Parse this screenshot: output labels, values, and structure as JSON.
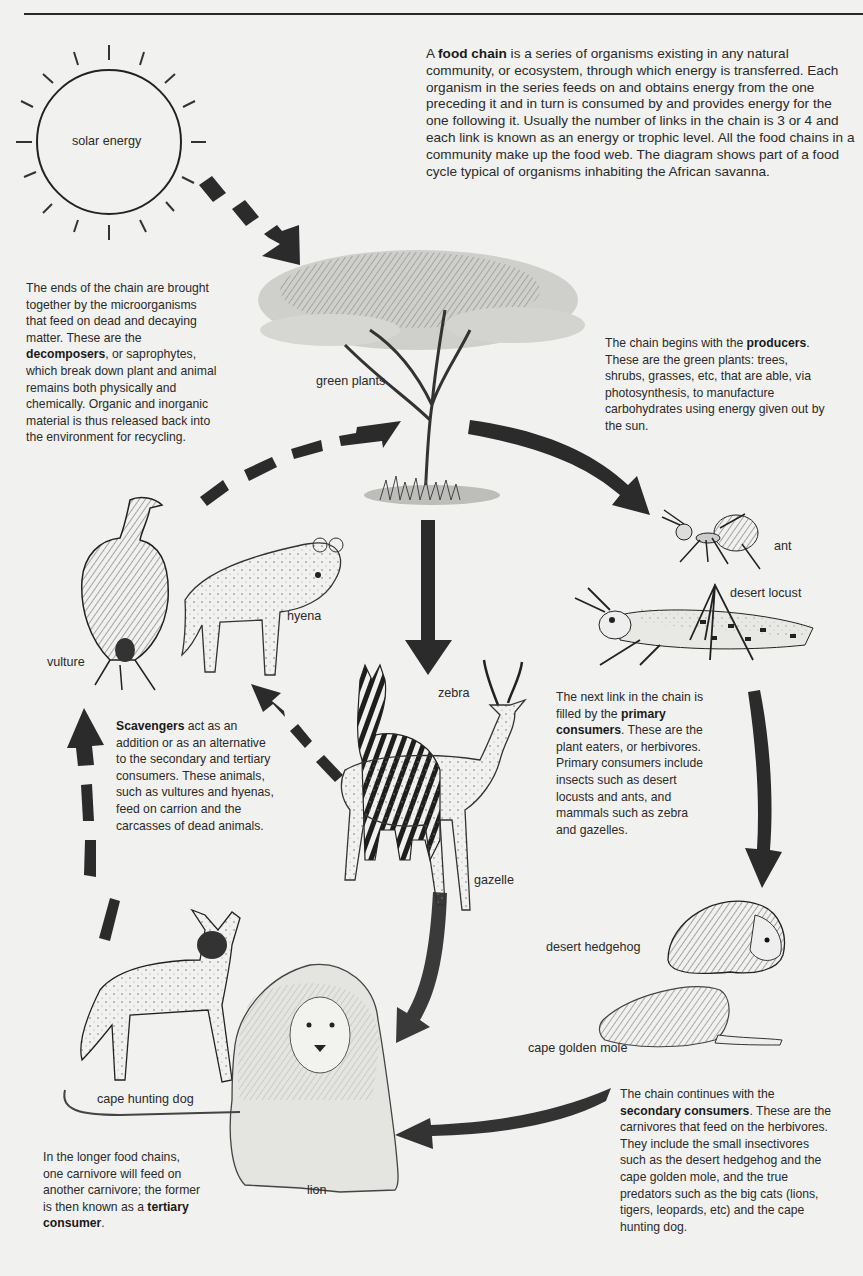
{
  "diagram": {
    "title_text": "Food chain of the African savanna",
    "intro": {
      "pre": "A ",
      "bold": "food chain",
      "post": " is a series of organisms existing in any natural community, or ecosystem, through which energy is transferred. Each organism in the series feeds on and obtains energy from the one preceding it and in turn is consumed by and provides energy for the one following it. Usually the number of links in the chain is 3 or 4 and each link is known as an energy or trophic level. All the food chains in a community make up the food web. The diagram shows part of a food cycle typical of organisms inhabiting the African savanna."
    },
    "decomposers": {
      "pre": "The ends of the chain are brought together by the microorganisms that feed on dead and decaying matter. These are the ",
      "bold": "decomposers",
      "post": ", or saprophytes, which break down plant and animal remains both physically and chemically. Organic and inorganic material is thus released back into the environment for recycling."
    },
    "producers": {
      "pre": "The chain begins with the ",
      "bold": "producers",
      "post": ". These are the green plants: trees, shrubs, grasses, etc, that are able, via photosynthesis, to manufacture carbohydrates using energy given out by the sun."
    },
    "primary": {
      "pre": "The next link in the chain is filled by the ",
      "bold": "primary consumers",
      "post": ". These are the plant eaters, or herbivores. Primary consumers include insects such as desert locusts and ants, and mammals such as zebra and gazelles."
    },
    "scavengers": {
      "pre": "",
      "bold": "Scavengers",
      "post": " act as an addition or as an alternative to the secondary and tertiary consumers. These animals, such as vultures and hyenas, feed on carrion and the carcasses of dead animals."
    },
    "secondary": {
      "pre": "The chain continues with the ",
      "bold": "secondary consumers",
      "post": ". These are the carnivores that feed on the herbivores. They include the small insectivores such as the desert hedgehog and the cape golden mole, and the true predators such as the big cats (lions, tigers, leopards, etc) and the cape hunting dog."
    },
    "tertiary": {
      "pre": "In the longer food chains, one carnivore will feed on another carnivore; the former is then known as a ",
      "bold": "tertiary consumer",
      "post": "."
    },
    "labels": {
      "sun": "solar energy",
      "plants": "green plants",
      "ant": "ant",
      "locust": "desert locust",
      "zebra": "zebra",
      "gazelle": "gazelle",
      "hyena": "hyena",
      "vulture": "vulture",
      "hedgehog": "desert hedgehog",
      "mole": "cape golden mole",
      "dog": "cape hunting dog",
      "lion": "lion"
    },
    "colors": {
      "background": "#f1f1ef",
      "ink": "#262626",
      "arrow": "#2b2b2b"
    }
  }
}
